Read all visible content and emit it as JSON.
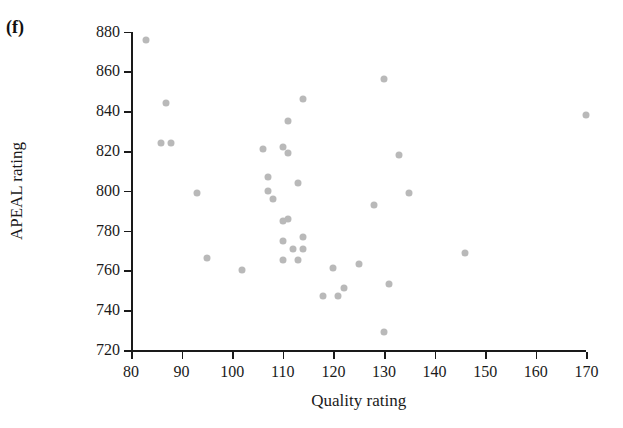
{
  "figure": {
    "panel_label": "(f)",
    "marker_color": "#b9b9b9",
    "axis_color": "#1a1a1a",
    "background_color": "#ffffff"
  },
  "chart_data": {
    "type": "scatter",
    "title": "",
    "xlabel": "Quality rating",
    "ylabel": "APEAL rating",
    "xlim": [
      80,
      170
    ],
    "ylim": [
      720,
      880
    ],
    "xticks": [
      80,
      90,
      100,
      110,
      120,
      130,
      140,
      150,
      160,
      170
    ],
    "yticks": [
      720,
      740,
      760,
      780,
      800,
      820,
      840,
      860,
      880
    ],
    "grid": false,
    "legend": null,
    "marker": "filled-circle",
    "points": [
      {
        "x": 83,
        "y": 876
      },
      {
        "x": 87,
        "y": 844
      },
      {
        "x": 86,
        "y": 824
      },
      {
        "x": 88,
        "y": 824
      },
      {
        "x": 93,
        "y": 799
      },
      {
        "x": 95,
        "y": 766
      },
      {
        "x": 102,
        "y": 760
      },
      {
        "x": 106,
        "y": 821
      },
      {
        "x": 111,
        "y": 835
      },
      {
        "x": 107,
        "y": 807
      },
      {
        "x": 110,
        "y": 822
      },
      {
        "x": 114,
        "y": 846
      },
      {
        "x": 108,
        "y": 796
      },
      {
        "x": 111,
        "y": 819
      },
      {
        "x": 107,
        "y": 800
      },
      {
        "x": 111,
        "y": 786
      },
      {
        "x": 110,
        "y": 785
      },
      {
        "x": 113,
        "y": 804
      },
      {
        "x": 110,
        "y": 775
      },
      {
        "x": 114,
        "y": 777
      },
      {
        "x": 112,
        "y": 771
      },
      {
        "x": 110,
        "y": 765
      },
      {
        "x": 113,
        "y": 765
      },
      {
        "x": 114,
        "y": 771
      },
      {
        "x": 120,
        "y": 761
      },
      {
        "x": 118,
        "y": 747
      },
      {
        "x": 121,
        "y": 747
      },
      {
        "x": 122,
        "y": 751
      },
      {
        "x": 125,
        "y": 763
      },
      {
        "x": 130,
        "y": 729
      },
      {
        "x": 128,
        "y": 793
      },
      {
        "x": 130,
        "y": 856
      },
      {
        "x": 131,
        "y": 753
      },
      {
        "x": 133,
        "y": 818
      },
      {
        "x": 135,
        "y": 799
      },
      {
        "x": 146,
        "y": 769
      },
      {
        "x": 170,
        "y": 838
      }
    ]
  }
}
